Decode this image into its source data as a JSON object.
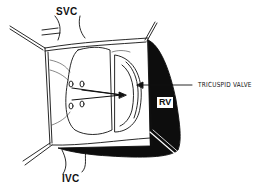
{
  "diagram": {
    "type": "surgical-illustration",
    "labels": {
      "svc": "SVC",
      "ivc": "IVC",
      "tricuspid_valve": "TRICUSPID VALVE",
      "rv": "RV"
    },
    "colors": {
      "ink": "#111111",
      "background": "#ffffff",
      "rv_fill": "#0d0d0d"
    }
  }
}
